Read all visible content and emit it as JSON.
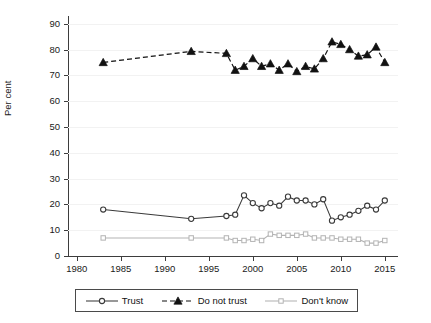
{
  "chart_data": {
    "type": "line",
    "title": "",
    "subtitle": "",
    "xlabel": "",
    "ylabel": "Per cent",
    "xlim": [
      1979,
      2016.5
    ],
    "ylim": [
      0,
      93
    ],
    "grid": true,
    "grid_axis": "y",
    "legend_position": "bottom",
    "y_ticks": [
      0,
      10,
      20,
      30,
      40,
      50,
      60,
      70,
      80,
      90
    ],
    "y_tick_labels": [
      "0",
      "10",
      "20",
      "30",
      "40",
      "50",
      "60",
      "70",
      "80",
      "90"
    ],
    "x_ticks": [
      1980,
      1985,
      1990,
      1995,
      2000,
      2005,
      2010,
      2015
    ],
    "x_tick_labels": [
      "1980",
      "1985",
      "1990",
      "1995",
      "2000",
      "2005",
      "2010",
      "2015"
    ],
    "series": [
      {
        "name": "Trust",
        "color": "#3a3a3a",
        "linestyle": "solid",
        "marker": "circle-open",
        "x": [
          1983,
          1993,
          1997,
          1998,
          1999,
          2000,
          2001,
          2002,
          2003,
          2004,
          2005,
          2006,
          2007,
          2008,
          2009,
          2010,
          2011,
          2012,
          2013,
          2014,
          2015
        ],
        "values": [
          18,
          14.4,
          15.5,
          16,
          23.5,
          20.5,
          18.5,
          20.5,
          19.5,
          23,
          21.5,
          21.5,
          20,
          22,
          13.7,
          15,
          16,
          17.5,
          19.5,
          18,
          21.5
        ]
      },
      {
        "name": "Do not trust",
        "color": "#111111",
        "linestyle": "dashed",
        "marker": "triangle-filled",
        "x": [
          1983,
          1993,
          1997,
          1998,
          1999,
          2000,
          2001,
          2002,
          2003,
          2004,
          2005,
          2006,
          2007,
          2008,
          2009,
          2010,
          2011,
          2012,
          2013,
          2014,
          2015
        ],
        "values": [
          75,
          79.3,
          78.5,
          72,
          73.5,
          76.5,
          73.5,
          74.5,
          72,
          74.5,
          71.5,
          73.5,
          72.5,
          76.5,
          83,
          82,
          80,
          77.5,
          78,
          81,
          75
        ]
      },
      {
        "name": "Don't know",
        "color": "#b3b3b3",
        "linestyle": "solid",
        "marker": "square-open",
        "x": [
          1983,
          1993,
          1997,
          1998,
          1999,
          2000,
          2001,
          2002,
          2003,
          2004,
          2005,
          2006,
          2007,
          2008,
          2009,
          2010,
          2011,
          2012,
          2013,
          2014,
          2015
        ],
        "values": [
          7,
          7,
          7,
          6,
          6,
          6.5,
          6,
          8.5,
          8,
          8,
          8,
          8.5,
          7,
          7,
          7,
          6.5,
          6.5,
          6.5,
          5,
          5,
          6
        ]
      }
    ]
  },
  "legend": {
    "items": [
      {
        "label": "Trust",
        "key": "line-open-circle-key"
      },
      {
        "label": "Do not trust",
        "key": "dashed-triangle-key"
      },
      {
        "label": "Don't know",
        "key": "line-open-square-key"
      }
    ]
  }
}
